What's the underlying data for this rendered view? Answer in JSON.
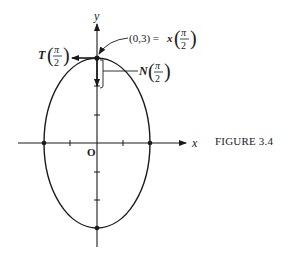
{
  "figure": {
    "caption": "FIGURE 3.4",
    "axes": {
      "x_label": "x",
      "y_label": "y",
      "origin_label": "O"
    },
    "labels": {
      "point": "(0,3) = ",
      "point_fn": "x",
      "tangent": "T",
      "normal": "N",
      "pi": "π",
      "two": "2"
    },
    "ellipse": {
      "semi_x": 2,
      "semi_y": 3
    },
    "colors": {
      "ink": "#1a1a1a",
      "background": "#ffffff"
    }
  }
}
